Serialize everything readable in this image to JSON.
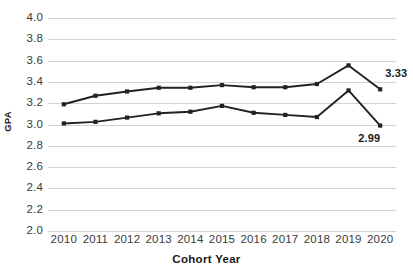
{
  "chart_data": {
    "type": "line",
    "title": "",
    "xlabel": "Cohort Year",
    "ylabel": "GPA",
    "categories": [
      "2010",
      "2011",
      "2012",
      "2013",
      "2014",
      "2015",
      "2016",
      "2017",
      "2018",
      "2019",
      "2020"
    ],
    "ylim": [
      2.0,
      4.0
    ],
    "ytick_labels": [
      "4.0",
      "3.8",
      "3.6",
      "3.4",
      "3.2",
      "3.0",
      "2.8",
      "2.6",
      "2.4",
      "2.2",
      "2.0"
    ],
    "ytick_values": [
      4.0,
      3.8,
      3.6,
      3.4,
      3.2,
      3.0,
      2.8,
      2.6,
      2.4,
      2.2,
      2.0
    ],
    "grid": true,
    "legend": "none",
    "series": [
      {
        "name": "upper-series",
        "color": "#222222",
        "values": [
          3.19,
          3.27,
          3.31,
          3.345,
          3.345,
          3.37,
          3.35,
          3.35,
          3.38,
          3.555,
          3.33
        ],
        "end_label": "3.33"
      },
      {
        "name": "lower-series",
        "color": "#222222",
        "values": [
          3.01,
          3.025,
          3.065,
          3.105,
          3.12,
          3.175,
          3.11,
          3.09,
          3.07,
          3.32,
          2.99
        ],
        "end_label": "2.99"
      }
    ],
    "annotations": [
      {
        "text": "3.33",
        "series": "upper-series",
        "category": "2020"
      },
      {
        "text": "2.99",
        "series": "lower-series",
        "category": "2020"
      }
    ]
  },
  "colors": {
    "line": "#222222",
    "grid": "#d2d2d2",
    "tick_text": "#3a3a3a",
    "title_text": "#1a1a1a",
    "background": "#ffffff"
  }
}
